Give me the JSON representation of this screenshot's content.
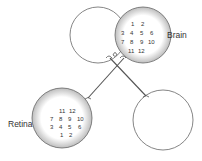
{
  "labels": {
    "brain": "Brain",
    "retina": "Retina"
  },
  "brain_grid": {
    "rows": [
      [
        "1",
        "2"
      ],
      [
        "3",
        "4",
        "5",
        "6"
      ],
      [
        "7",
        "8",
        "9",
        "10"
      ],
      [
        "11",
        "12"
      ]
    ]
  },
  "retina_grid": {
    "rows": [
      [
        "11",
        "12"
      ],
      [
        "7",
        "8",
        "9",
        "10"
      ],
      [
        "3",
        "4",
        "5",
        "6"
      ],
      [
        "1",
        "2"
      ]
    ]
  },
  "colors": {
    "outline": "#555555",
    "shade": "#cfcfcf",
    "text": "#333333"
  }
}
